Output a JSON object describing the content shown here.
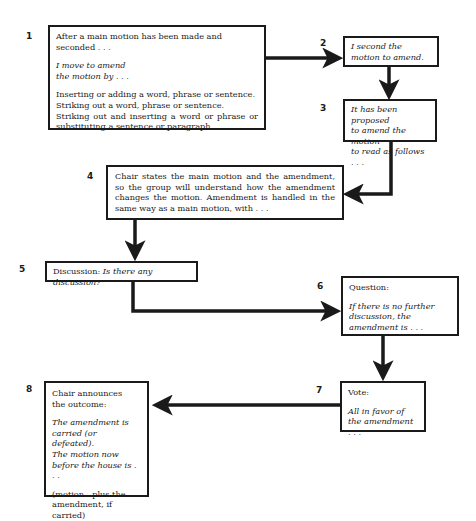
{
  "diagram": {
    "type": "flowchart",
    "steps": [
      {
        "number": "1",
        "lines": {
          "intro": "After a main motion has been made and seconded . . .",
          "quote1": "I move to amend",
          "quote2": "the motion by . . .",
          "opt1": "Inserting or adding a word, phrase or sentence.",
          "opt2": "Striking out a word, phrase or sentence.",
          "opt3": "Striking out and inserting a word or phrase or substituting a sentence or paragraph."
        }
      },
      {
        "number": "2",
        "lines": {
          "quote1": "I second the",
          "quote2": "motion to amend."
        }
      },
      {
        "number": "3",
        "lines": {
          "quote1": "It has been proposed",
          "quote2": "to amend the motion",
          "quote3": "to read as follows . . ."
        }
      },
      {
        "number": "4",
        "lines": {
          "text": "Chair states the main motion and the amendment, so the group will understand how the amendment changes the motion. Amendment is handled in the same way as a main motion, with . . ."
        }
      },
      {
        "number": "5",
        "lines": {
          "label": "Discussion: ",
          "quote": "Is there any discussion?"
        }
      },
      {
        "number": "6",
        "lines": {
          "label": "Question:",
          "quote": "If there is no further discussion, the amendment is . . ."
        }
      },
      {
        "number": "7",
        "lines": {
          "label": "Vote:",
          "quote1": "All in favor of",
          "quote2": "the amendment . . ."
        }
      },
      {
        "number": "8",
        "lines": {
          "label1": "Chair announces",
          "label2": "the outcome:",
          "quote1": "The amendment is",
          "quote2": "carried (or defeated).",
          "quote3": "The motion now",
          "quote4": "before the house is . . .",
          "note1": "(motion—plus the",
          "note2": "amendment, if carried)"
        }
      }
    ],
    "connections": [
      {
        "from": "1",
        "to": "2",
        "direction": "right"
      },
      {
        "from": "2",
        "to": "3",
        "direction": "down"
      },
      {
        "from": "3",
        "to": "4",
        "direction": "down-left"
      },
      {
        "from": "4",
        "to": "5",
        "direction": "down"
      },
      {
        "from": "5",
        "to": "6",
        "direction": "down-right"
      },
      {
        "from": "6",
        "to": "7",
        "direction": "down"
      },
      {
        "from": "7",
        "to": "8",
        "direction": "left"
      }
    ],
    "colors": {
      "ink": "#1a1a1a",
      "background": "#ffffff"
    }
  }
}
